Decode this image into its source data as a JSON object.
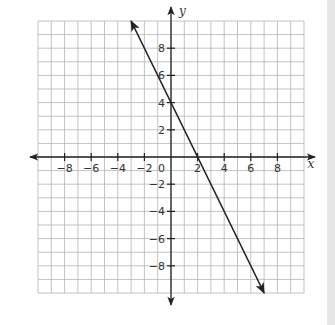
{
  "chart_data": {
    "type": "line",
    "title": "",
    "xlabel": "x",
    "ylabel": "y",
    "xlim": [
      -10,
      10
    ],
    "ylim": [
      -10,
      10
    ],
    "grid": true,
    "grid_step": 1,
    "x_ticks": [
      -8,
      -6,
      -4,
      -2,
      2,
      4,
      6,
      8
    ],
    "y_ticks": [
      8,
      6,
      4,
      2,
      -2,
      -4,
      -6,
      -8
    ],
    "origin_label": "0",
    "series": [
      {
        "name": "line",
        "equation": "y = -2x + 4",
        "slope": -2,
        "y_intercept": 4,
        "x_intercept": 2,
        "points": [
          [
            -3,
            10
          ],
          [
            0,
            4
          ],
          [
            2,
            0
          ],
          [
            7,
            -10
          ]
        ],
        "arrows_both_ends": true
      }
    ],
    "legend": null
  },
  "colors": {
    "background": "#ffffff",
    "grid": "#b4b4b4",
    "axes": "#222222",
    "line": "#222222",
    "edge_strip": "#e6e6e6"
  }
}
